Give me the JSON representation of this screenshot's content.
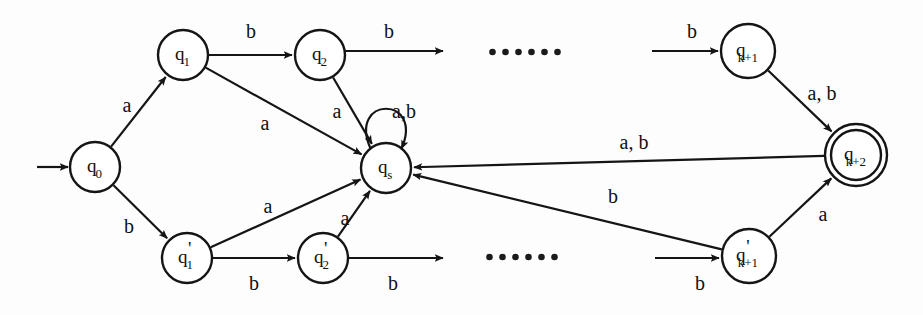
{
  "figure": {
    "kind": "finite-automaton-state-diagram",
    "alphabet": [
      "a",
      "b"
    ],
    "background_color": "#fdfdfd",
    "ink_color": "#151515"
  },
  "states": [
    {
      "id": "q0",
      "label_main": "q",
      "label_sub": "0",
      "prime": false,
      "cx": 95,
      "cy": 167,
      "r": 25,
      "accepting": false,
      "start": true
    },
    {
      "id": "q1",
      "label_main": "q",
      "label_sub": "1",
      "prime": false,
      "cx": 183,
      "cy": 55,
      "r": 25,
      "accepting": false,
      "start": false
    },
    {
      "id": "q2",
      "label_main": "q",
      "label_sub": "2",
      "prime": false,
      "cx": 320,
      "cy": 55,
      "r": 25,
      "accepting": false,
      "start": false
    },
    {
      "id": "qk1",
      "label_main": "q",
      "label_sub": "k+1",
      "prime": false,
      "cx": 748,
      "cy": 51,
      "r": 27,
      "accepting": false,
      "start": false
    },
    {
      "id": "qs",
      "label_main": "q",
      "label_sub": "s",
      "prime": false,
      "cx": 386,
      "cy": 168,
      "r": 25,
      "accepting": false,
      "start": false
    },
    {
      "id": "qk2",
      "label_main": "q",
      "label_sub": "k+2",
      "prime": false,
      "cx": 856,
      "cy": 155,
      "r": 31,
      "accepting": true,
      "start": false
    },
    {
      "id": "q1p",
      "label_main": "q",
      "label_sub": "1",
      "prime": true,
      "cx": 187,
      "cy": 258,
      "r": 25,
      "accepting": false,
      "start": false
    },
    {
      "id": "q2p",
      "label_main": "q",
      "label_sub": "2",
      "prime": true,
      "cx": 323,
      "cy": 258,
      "r": 25,
      "accepting": false,
      "start": false
    },
    {
      "id": "qk1p",
      "label_main": "q",
      "label_sub": "k+1",
      "prime": true,
      "cx": 749,
      "cy": 256,
      "r": 27,
      "accepting": false,
      "start": false
    }
  ],
  "start_arrow": {
    "from_x": 37,
    "from_y": 167,
    "to_x": 68,
    "to_y": 167
  },
  "transitions": [
    {
      "id": "t-q0-q1",
      "from": "q0",
      "to": "q1",
      "symbol": "a",
      "label_x": 127,
      "label_y": 107
    },
    {
      "id": "t-q0-q1p",
      "from": "q0",
      "to": "q1p",
      "symbol": "b",
      "label_x": 129,
      "label_y": 228
    },
    {
      "id": "t-q1-q2",
      "from": "q1",
      "to": "q2",
      "symbol": "b",
      "label_x": 251,
      "label_y": 33
    },
    {
      "id": "t-q2-out",
      "from": "q2",
      "to": "open",
      "symbol": "b",
      "label_x": 389,
      "label_y": 33
    },
    {
      "id": "t-q1-qs",
      "from": "q1",
      "to": "qs",
      "symbol": "a",
      "label_x": 265,
      "label_y": 125
    },
    {
      "id": "t-q2-qs",
      "from": "q2",
      "to": "qs",
      "symbol": "a",
      "label_x": 337,
      "label_y": 113
    },
    {
      "id": "t-qs-self",
      "from": "qs",
      "to": "qs",
      "symbol": "a,b",
      "label_x": 404,
      "label_y": 113
    },
    {
      "id": "t-in-qk1",
      "from": "open",
      "to": "qk1",
      "symbol": "b",
      "label_x": 692,
      "label_y": 33
    },
    {
      "id": "t-qk1-qk2",
      "from": "qk1",
      "to": "qk2",
      "symbol": "a, b",
      "label_x": 822,
      "label_y": 95
    },
    {
      "id": "t-qk2-qs",
      "from": "qk2",
      "to": "qs",
      "symbol": "a, b",
      "label_x": 634,
      "label_y": 144
    },
    {
      "id": "t-q1p-qs",
      "from": "q1p",
      "to": "qs",
      "symbol": "a",
      "label_x": 268,
      "label_y": 208
    },
    {
      "id": "t-q1p-q2p",
      "from": "q1p",
      "to": "q2p",
      "symbol": "b",
      "label_x": 254,
      "label_y": 285
    },
    {
      "id": "t-q2p-qs",
      "from": "q2p",
      "to": "qs",
      "symbol": "a",
      "label_x": 345,
      "label_y": 220
    },
    {
      "id": "t-q2p-out",
      "from": "q2p",
      "to": "open",
      "symbol": "b",
      "label_x": 393,
      "label_y": 285
    },
    {
      "id": "t-in-qk1p",
      "from": "open",
      "to": "qk1p",
      "symbol": "b",
      "label_x": 700,
      "label_y": 285
    },
    {
      "id": "t-qk1p-qk2",
      "from": "qk1p",
      "to": "qk2",
      "symbol": "a",
      "label_x": 823,
      "label_y": 216
    },
    {
      "id": "t-qk1p-qs",
      "from": "qk1p",
      "to": "qs",
      "symbol": "b",
      "label_x": 613,
      "label_y": 198
    }
  ],
  "ellipses": [
    {
      "id": "ellipsis-top",
      "cx": 525,
      "cy": 52,
      "dots": 6
    },
    {
      "id": "ellipsis-bottom",
      "cx": 522,
      "cy": 257,
      "dots": 6
    }
  ],
  "open_edges": [
    {
      "id": "open-top-out",
      "x1": 345,
      "y1": 51,
      "x2": 443,
      "y2": 51
    },
    {
      "id": "open-top-in",
      "x1": 652,
      "y1": 51,
      "x2": 718,
      "y2": 51
    },
    {
      "id": "open-bottom-out",
      "x1": 348,
      "y1": 258,
      "x2": 443,
      "y2": 258
    },
    {
      "id": "open-bottom-in",
      "x1": 655,
      "y1": 258,
      "x2": 719,
      "y2": 258
    }
  ]
}
